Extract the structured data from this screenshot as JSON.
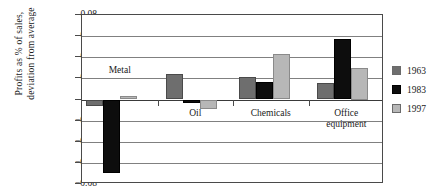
{
  "chart_data": {
    "type": "bar",
    "title": "",
    "xlabel": "",
    "ylabel": "Profits as % of sales, deviation from average",
    "ylabel_lines": [
      "Profits as % of sales,",
      "deviation from average"
    ],
    "categories": [
      "Metal",
      "Oil",
      "Chemicals",
      "Office equipment"
    ],
    "category_label_lines": [
      [
        "Metal"
      ],
      [
        "Oil"
      ],
      [
        "Chemicals"
      ],
      [
        "Office",
        "equipment"
      ]
    ],
    "series": [
      {
        "name": "1963",
        "color": "#6e6e6e",
        "values": [
          -0.006,
          0.024,
          0.021,
          0.016
        ]
      },
      {
        "name": "1983",
        "color": "#0d0d0d",
        "values": [
          -0.07,
          -0.003,
          0.017,
          0.057
        ]
      },
      {
        "name": "1997",
        "color": "#b7b7b7",
        "values": [
          0.003,
          -0.009,
          0.043,
          0.03
        ]
      }
    ],
    "ylim": [
      -0.08,
      0.08
    ],
    "ytick_values": [
      0.08,
      0.06,
      0.04,
      0.02,
      0,
      -0.02,
      -0.04,
      -0.06,
      -0.08
    ],
    "ytick_labels": [
      "0.08",
      "0.06",
      "0.04",
      "0.02",
      "0",
      "−0.02",
      "−0.04",
      "−0.06",
      "−0.08"
    ],
    "grid": true,
    "legend_position": "right",
    "legend_entries": [
      "1963",
      "1983",
      "1997"
    ]
  },
  "colors": {
    "frame": "#4a4a4a",
    "grid": "#808080",
    "background": "#ffffff",
    "text": "#1a1a1a"
  }
}
